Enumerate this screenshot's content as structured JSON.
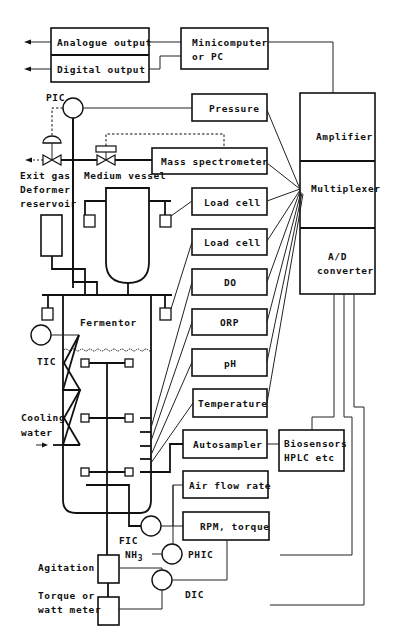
{
  "diagram": {
    "colors": {
      "line": "#111111",
      "background": "#ffffff"
    },
    "outputs": {
      "analogue_output": "Analogue output",
      "digital_output": "Digital output"
    },
    "computer": {
      "line1": "Minicomputer",
      "line2": "or PC"
    },
    "interface_stack": {
      "amplifier": "Amplifier",
      "multiplexer": "Multiplexer",
      "ad_line1": "A/D",
      "ad_line2": "converter"
    },
    "sensor_boxes": {
      "pressure": "Pressure",
      "mass_spectrometer": "Mass spectrometer",
      "load_cell_1": "Load cell",
      "load_cell_2": "Load cell",
      "do": "DO",
      "orp": "ORP",
      "ph": "pH",
      "temperature": "Temperature",
      "autosampler": "Autosampler",
      "air_flow_rate": "Air flow rate",
      "rpm_torque": "RPM, torque"
    },
    "biosensors": {
      "line1": "Biosensors",
      "line2": "HPLC etc"
    },
    "labels": {
      "pic": "PIC",
      "exit_gas": "Exit gas",
      "deformer": "Deformer",
      "reservoir": "reservoir",
      "medium_vessel": "Medium vessel",
      "fermentor": "Fermentor",
      "tic": "TIC",
      "cooling": "Cooling",
      "water": "water",
      "fic": "FIC",
      "nh3": "NH",
      "nh3_sub": "3",
      "phic": "PHIC",
      "dic": "DIC",
      "agitation": "Agitation",
      "torque_or": "Torque or",
      "watt_meter": "watt meter"
    }
  }
}
